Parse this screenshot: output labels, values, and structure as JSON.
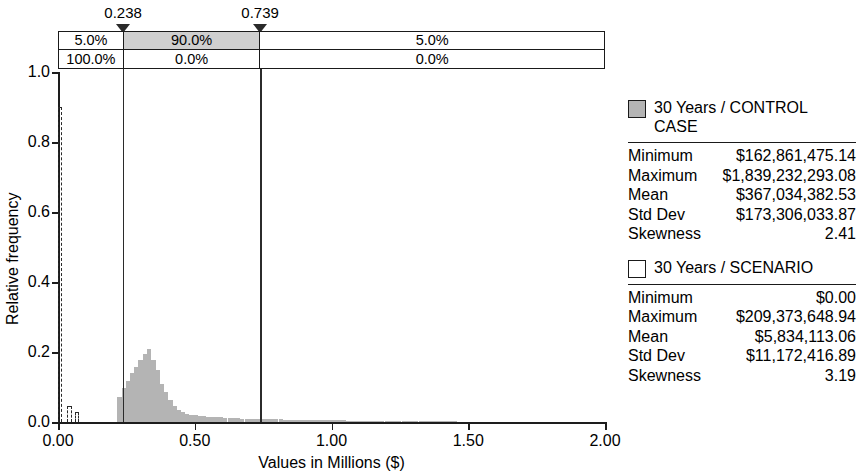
{
  "chart_data": {
    "type": "bar",
    "title": "",
    "xlabel": "Values in Millions ($)",
    "ylabel": "Relative frequency",
    "xlim": [
      0.0,
      2.0
    ],
    "ylim": [
      0.0,
      1.0
    ],
    "grid": false,
    "legend_position": "right",
    "xticks": [
      "0.00",
      "0.50",
      "1.00",
      "1.50",
      "2.00"
    ],
    "xtick_values": [
      0.0,
      0.5,
      1.0,
      1.5,
      2.0
    ],
    "yticks": [
      "0.0",
      "0.2",
      "0.4",
      "0.6",
      "0.8",
      "1.0"
    ],
    "ytick_values": [
      0.0,
      0.2,
      0.4,
      0.6,
      0.8,
      1.0
    ],
    "markers": [
      {
        "label": "0.238",
        "value": 0.238
      },
      {
        "label": "0.739",
        "value": 0.739
      }
    ],
    "percentile_table": {
      "rows": [
        {
          "series": "30 Years / CONTROL CASE",
          "cells": [
            "5.0%",
            "90.0%",
            "5.0%"
          ],
          "highlight_index": 1
        },
        {
          "series": "30 Years / SCENARIO",
          "cells": [
            "100.0%",
            "0.0%",
            "0.0%"
          ],
          "highlight_index": -1
        }
      ]
    },
    "series": [
      {
        "name": "30 Years / CONTROL CASE",
        "style": "filled-gray",
        "color": "#b4b4b4",
        "bin_width": 0.0155,
        "x": [
          0.225,
          0.24,
          0.256,
          0.271,
          0.287,
          0.302,
          0.318,
          0.333,
          0.349,
          0.364,
          0.38,
          0.395,
          0.411,
          0.426,
          0.442,
          0.457,
          0.473,
          0.488,
          0.504,
          0.519,
          0.535,
          0.55,
          0.566,
          0.581,
          0.597,
          0.612,
          0.628,
          0.643,
          0.659,
          0.674,
          0.69,
          0.705,
          0.721,
          0.736,
          0.752,
          0.767,
          0.783,
          0.798,
          0.814,
          0.829,
          0.845,
          0.86,
          0.876,
          0.891,
          0.907,
          0.922,
          0.938,
          0.953,
          0.969,
          0.984,
          1.0,
          1.016,
          1.031,
          1.047,
          1.062,
          1.078,
          1.093,
          1.109,
          1.124,
          1.14,
          1.155,
          1.171,
          1.186,
          1.202,
          1.217,
          1.233,
          1.248,
          1.264,
          1.279,
          1.295,
          1.31,
          1.326,
          1.341,
          1.357,
          1.372,
          1.388,
          1.403,
          1.419,
          1.434,
          1.45
        ],
        "values": [
          0.072,
          0.096,
          0.118,
          0.139,
          0.157,
          0.178,
          0.194,
          0.208,
          0.177,
          0.15,
          0.11,
          0.086,
          0.062,
          0.046,
          0.035,
          0.028,
          0.024,
          0.021,
          0.019,
          0.017,
          0.016,
          0.015,
          0.014,
          0.013,
          0.013,
          0.012,
          0.012,
          0.011,
          0.011,
          0.01,
          0.01,
          0.01,
          0.009,
          0.009,
          0.009,
          0.008,
          0.008,
          0.008,
          0.008,
          0.007,
          0.007,
          0.007,
          0.007,
          0.006,
          0.006,
          0.006,
          0.006,
          0.006,
          0.005,
          0.005,
          0.005,
          0.005,
          0.005,
          0.005,
          0.004,
          0.004,
          0.004,
          0.004,
          0.004,
          0.004,
          0.004,
          0.003,
          0.003,
          0.003,
          0.003,
          0.003,
          0.003,
          0.003,
          0.003,
          0.003,
          0.002,
          0.002,
          0.002,
          0.002,
          0.002,
          0.002,
          0.002,
          0.002,
          0.002,
          0.002
        ]
      },
      {
        "name": "30 Years / SCENARIO",
        "style": "dashed-outline",
        "color": "#2a2a2a",
        "bin_width": 0.0155,
        "x": [
          0.008,
          0.042,
          0.07
        ],
        "values": [
          0.9,
          0.045,
          0.03
        ]
      }
    ],
    "stats_panel": [
      {
        "series": "30 Years / CONTROL CASE",
        "swatch": "filled",
        "rows": [
          {
            "name": "Minimum",
            "value": "$162,861,475.14"
          },
          {
            "name": "Maximum",
            "value": "$1,839,232,293.08"
          },
          {
            "name": "Mean",
            "value": "$367,034,382.53"
          },
          {
            "name": "Std Dev",
            "value": "$173,306,033.87"
          },
          {
            "name": "Skewness",
            "value": "2.41"
          }
        ]
      },
      {
        "series": "30 Years / SCENARIO",
        "swatch": "empty",
        "rows": [
          {
            "name": "Minimum",
            "value": "$0.00"
          },
          {
            "name": "Maximum",
            "value": "$209,373,648.94"
          },
          {
            "name": "Mean",
            "value": "$5,834,113.06"
          },
          {
            "name": "Std Dev",
            "value": "$11,172,416.89"
          },
          {
            "name": "Skewness",
            "value": "3.19"
          }
        ]
      }
    ]
  },
  "legend": {
    "entries": [
      {
        "label": "30 Years / CONTROL CASE",
        "swatch": "filled"
      },
      {
        "label": "30 Years / SCENARIO",
        "swatch": "empty"
      }
    ]
  },
  "axes": {
    "ylabel": "Relative frequency",
    "xlabel": "Values in Millions ($)"
  }
}
